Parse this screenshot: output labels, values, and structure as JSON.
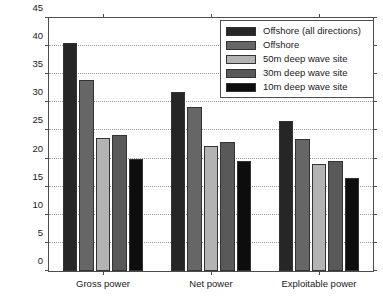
{
  "chart_data": {
    "type": "bar",
    "title": "",
    "xlabel": "",
    "ylabel": "Average incident wave power (kW)",
    "categories": [
      "Gross power",
      "Net power",
      "Exploitable power"
    ],
    "ylim": [
      0,
      45
    ],
    "yticks": [
      0,
      5,
      10,
      15,
      20,
      25,
      30,
      35,
      40,
      45
    ],
    "ytick_labels": [
      "0",
      "5",
      "10",
      "15",
      "20",
      "25",
      "30",
      "35",
      "40",
      "45"
    ],
    "grid": "horizontal-dotted",
    "legend_position": "top-right",
    "series": [
      {
        "name": "Offshore (all directions)",
        "color": "#262626",
        "values": [
          40.5,
          31.8,
          26.7
        ]
      },
      {
        "name": "Offshore",
        "color": "#666666",
        "values": [
          34.0,
          29.1,
          23.5
        ]
      },
      {
        "name": "50m deep wave site",
        "color": "#b3b3b3",
        "values": [
          23.7,
          22.3,
          19.0
        ]
      },
      {
        "name": "30m deep wave site",
        "color": "#595959",
        "values": [
          24.2,
          22.9,
          19.5
        ]
      },
      {
        "name": "10m deep wave site",
        "color": "#0d0d0d",
        "values": [
          20.0,
          19.6,
          16.6
        ]
      }
    ]
  }
}
